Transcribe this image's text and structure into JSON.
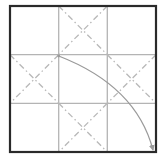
{
  "diagram": {
    "type": "origami-fold-diagram",
    "grid": {
      "rows": 3,
      "cols": 3,
      "outer_square": {
        "x": 10,
        "y": 6,
        "size": 146
      },
      "vertical_lines_x": [
        58.7,
        107.3
      ],
      "horizontal_lines_y": [
        54.7,
        103.3
      ]
    },
    "colors": {
      "background": "#ffffff",
      "border": "#2a2a2a",
      "grid_line": "#b4b4b4",
      "dash_line": "#b8b8b8",
      "arrow": "#9a9a9a"
    },
    "dashed_diagonals": [
      {
        "cell": "top-middle",
        "lines": [
          [
            58.7,
            6,
            107.3,
            54.7
          ],
          [
            107.3,
            6,
            58.7,
            54.7
          ]
        ]
      },
      {
        "cell": "middle-left",
        "lines": [
          [
            10,
            54.7,
            58.7,
            103.3
          ],
          [
            58.7,
            54.7,
            10,
            103.3
          ]
        ]
      },
      {
        "cell": "middle-right",
        "lines": [
          [
            107.3,
            54.7,
            156,
            103.3
          ],
          [
            156,
            54.7,
            107.3,
            103.3
          ]
        ]
      },
      {
        "cell": "bottom-middle",
        "lines": [
          [
            58.7,
            103.3,
            107.3,
            152
          ],
          [
            107.3,
            103.3,
            58.7,
            152
          ]
        ]
      }
    ],
    "fold_arrow": {
      "start": [
        58.7,
        56
      ],
      "end": [
        153,
        151
      ],
      "path": "M 58.7 56 C 100 72, 140 100, 153 150",
      "description": "curved arrow showing fold from inner corner to outer bottom-right corner"
    }
  }
}
